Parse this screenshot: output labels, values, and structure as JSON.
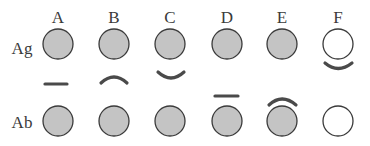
{
  "diagram": {
    "columns": [
      "A",
      "B",
      "C",
      "D",
      "E",
      "F"
    ],
    "rows": [
      "Ag",
      "Ab"
    ],
    "colors": {
      "filled": "#c4c4c4",
      "empty": "#ffffff",
      "stroke": "#3a3a3a",
      "connector": "#4a4a4a"
    },
    "circles": {
      "Ag": [
        "filled",
        "filled",
        "filled",
        "filled",
        "filled",
        "empty"
      ],
      "Ab": [
        "filled",
        "filled",
        "filled",
        "filled",
        "filled",
        "empty"
      ]
    },
    "connectors": [
      {
        "column": "A",
        "shape": "flat",
        "position": "middle"
      },
      {
        "column": "B",
        "shape": "arch-up",
        "position": "middle"
      },
      {
        "column": "C",
        "shape": "arch-down",
        "position": "middle"
      },
      {
        "column": "D",
        "shape": "flat",
        "position": "near-Ab"
      },
      {
        "column": "E",
        "shape": "arch-up",
        "position": "touching-Ab"
      },
      {
        "column": "F",
        "shape": "arch-down",
        "position": "touching-Ag"
      }
    ]
  }
}
